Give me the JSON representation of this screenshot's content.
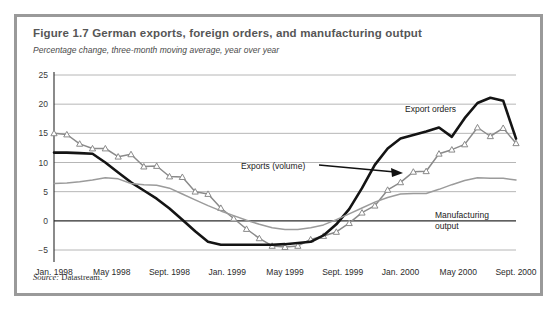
{
  "figure": {
    "title": "Figure 1.7  German exports, foreign orders, and manufacturing output",
    "subtitle": "Percentage change, three-month moving average, year over year",
    "source_prefix": "Source:",
    "source_text": " Datastream.",
    "border_color": "#9a9a9a"
  },
  "chart_data": {
    "type": "line",
    "title": "Figure 1.7  German exports, foreign orders, and manufacturing output",
    "subtitle": "Percentage change, three-month moving average, year over year",
    "xlabel": "",
    "ylabel": "",
    "ylim": [
      -5,
      25
    ],
    "yticks": [
      25,
      20,
      15,
      10,
      5,
      0,
      -5
    ],
    "ytick_labels": [
      "25",
      "20",
      "15",
      "10",
      "5",
      "0",
      "−5"
    ],
    "grid": true,
    "legend": "annotations",
    "x_tick_labels": [
      "Jan. 1998",
      "May 1998",
      "Sept. 1998",
      "Jan. 1999",
      "May 1999",
      "Sept. 1999",
      "Jan. 2000",
      "May 2000",
      "Sept. 2000"
    ],
    "x_tick_months": [
      0,
      4,
      8,
      12,
      16,
      20,
      24,
      28,
      32
    ],
    "x_range_months": [
      0,
      32
    ],
    "annotations": [
      {
        "name": "export-orders-label",
        "text": "Export orders"
      },
      {
        "name": "exports-volume-label",
        "text": "Exports (volume)"
      },
      {
        "name": "manufacturing-output-label",
        "text": "Manufacturing"
      },
      {
        "name": "manufacturing-output-label-2",
        "text": "output"
      }
    ],
    "series": [
      {
        "name": "Exports (volume)",
        "color": "#8a8a8a",
        "marker": "triangle",
        "values": [
          15.0,
          14.8,
          13.2,
          12.4,
          12.4,
          11.0,
          11.4,
          9.3,
          9.4,
          7.6,
          7.5,
          5.0,
          4.6,
          2.2,
          0.4,
          -1.4,
          -3.0,
          -4.3,
          -4.5,
          -4.3,
          -3.2,
          -2.6,
          -1.9,
          -0.4,
          1.4,
          2.6,
          5.3,
          6.6,
          8.4,
          8.5,
          11.5,
          12.2,
          13.1,
          16.0,
          14.5,
          15.9,
          13.3
        ]
      },
      {
        "name": "Export orders",
        "color": "#141414",
        "marker": "none",
        "values": [
          11.7,
          11.7,
          11.6,
          11.5,
          10.0,
          8.3,
          6.6,
          5.2,
          3.8,
          2.1,
          0.2,
          -1.8,
          -3.6,
          -4.1,
          -4.1,
          -4.1,
          -4.1,
          -4.1,
          -4.0,
          -3.8,
          -3.6,
          -2.5,
          -0.6,
          2.0,
          5.6,
          9.6,
          12.4,
          14.1,
          14.7,
          15.3,
          16.0,
          14.4,
          17.6,
          20.2,
          21.1,
          20.6,
          14.1
        ]
      },
      {
        "name": "Manufacturing output",
        "color": "#9b9b9b",
        "marker": "none",
        "values": [
          6.4,
          6.5,
          6.7,
          7.0,
          7.4,
          7.2,
          6.4,
          6.2,
          6.1,
          5.6,
          4.6,
          3.6,
          2.6,
          1.7,
          0.9,
          0.1,
          -0.6,
          -1.2,
          -1.5,
          -1.5,
          -1.2,
          -0.7,
          0.2,
          1.2,
          2.2,
          3.2,
          4.0,
          4.6,
          4.7,
          4.7,
          5.4,
          6.2,
          6.9,
          7.4,
          7.3,
          7.3,
          7.0
        ]
      }
    ]
  }
}
